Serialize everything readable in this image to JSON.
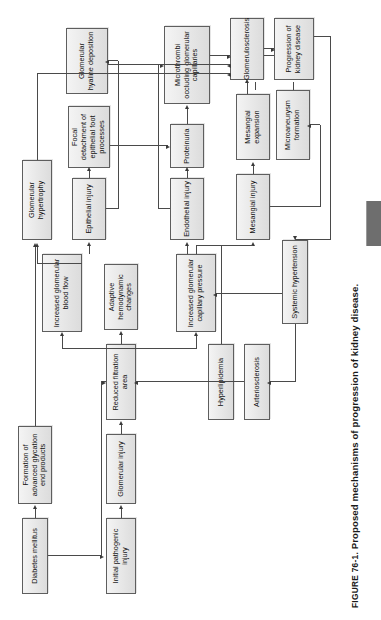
{
  "figure": {
    "number": "FIGURE 76-1.",
    "title": "Proposed mechanisms of progression of kidney disease.",
    "page_element": "printed-thumb-tab"
  },
  "diagram": {
    "type": "flowchart",
    "orientation": "rotated-90-counterclockwise",
    "nodes": [
      {
        "id": "initial_pathogenic_injury",
        "label": "Initial pathogenic injury"
      },
      {
        "id": "glomerular_injury",
        "label": "Glomerular injury"
      },
      {
        "id": "reduced_filtration_area",
        "label": "Reduced filtration area"
      },
      {
        "id": "adaptive_hemodynamic",
        "label": "Adaptive hemodynamic changes"
      },
      {
        "id": "diabetes_mellitus",
        "label": "Diabetes mellitus"
      },
      {
        "id": "advanced_glycation",
        "label": "Formation of advanced glycation end products"
      },
      {
        "id": "arteriosclerosis",
        "label": "Arteriosclerosis"
      },
      {
        "id": "hyperlipidemia",
        "label": "Hyperlipidemia"
      },
      {
        "id": "systemic_hypertension",
        "label": "Systemic hypertension"
      },
      {
        "id": "incr_glom_cap_pressure",
        "label": "Increased glomerular capillary pressure"
      },
      {
        "id": "incr_glom_blood_flow",
        "label": "Increased glomerular blood flow"
      },
      {
        "id": "mesangial_injury",
        "label": "Mesangial injury"
      },
      {
        "id": "mesangial_expansion",
        "label": "Mesangial expansion"
      },
      {
        "id": "microaneurysm_formation",
        "label": "Microaneurysm formation"
      },
      {
        "id": "endothelial_injury",
        "label": "Endothelial injury"
      },
      {
        "id": "epithelial_injury",
        "label": "Epithelial injury"
      },
      {
        "id": "proteinuria",
        "label": "Proteinuria"
      },
      {
        "id": "focal_detachment",
        "label": "Focal detachment of epithelial foot processes"
      },
      {
        "id": "glomerular_hypertrophy",
        "label": "Glomerular hypertrophy"
      },
      {
        "id": "glomerular_hyaline",
        "label": "Glomerular hyaline deposition"
      },
      {
        "id": "microthrombi",
        "label": "Microthrombi occluding glomerular capillaries"
      },
      {
        "id": "glomerulosclerosis",
        "label": "Glomerulosclerosis"
      },
      {
        "id": "progression_kidney_disease",
        "label": "Progression of kidney disease"
      }
    ],
    "edges": [
      {
        "from": "initial_pathogenic_injury",
        "to": "glomerular_injury"
      },
      {
        "from": "glomerular_injury",
        "to": "reduced_filtration_area"
      },
      {
        "from": "reduced_filtration_area",
        "to": "adaptive_hemodynamic"
      },
      {
        "from": "diabetes_mellitus",
        "to": "reduced_filtration_area"
      },
      {
        "from": "diabetes_mellitus",
        "to": "advanced_glycation"
      },
      {
        "from": "advanced_glycation",
        "to": "glomerular_hypertrophy"
      },
      {
        "from": "systemic_hypertension",
        "to": "arteriosclerosis"
      },
      {
        "from": "systemic_hypertension",
        "to": "incr_glom_cap_pressure"
      },
      {
        "from": "arteriosclerosis",
        "to": "reduced_filtration_area"
      },
      {
        "from": "hyperlipidemia",
        "to": "mesangial_injury"
      },
      {
        "from": "adaptive_hemodynamic",
        "to": "incr_glom_cap_pressure"
      },
      {
        "from": "adaptive_hemodynamic",
        "to": "incr_glom_blood_flow"
      },
      {
        "from": "incr_glom_cap_pressure",
        "to": "mesangial_injury"
      },
      {
        "from": "incr_glom_cap_pressure",
        "to": "endothelial_injury"
      },
      {
        "from": "incr_glom_blood_flow",
        "to": "epithelial_injury"
      },
      {
        "from": "incr_glom_blood_flow",
        "to": "glomerular_hypertrophy"
      },
      {
        "from": "mesangial_injury",
        "to": "mesangial_expansion"
      },
      {
        "from": "mesangial_injury",
        "to": "microaneurysm_formation"
      },
      {
        "from": "mesangial_expansion",
        "to": "glomerulosclerosis"
      },
      {
        "from": "microaneurysm_formation",
        "to": "glomerulosclerosis"
      },
      {
        "from": "endothelial_injury",
        "to": "proteinuria"
      },
      {
        "from": "endothelial_injury",
        "to": "microthrombi"
      },
      {
        "from": "epithelial_injury",
        "to": "focal_detachment"
      },
      {
        "from": "epithelial_injury",
        "to": "glomerular_hyaline"
      },
      {
        "from": "focal_detachment",
        "to": "proteinuria"
      },
      {
        "from": "proteinuria",
        "to": "microthrombi"
      },
      {
        "from": "glomerular_hyaline",
        "to": "glomerulosclerosis"
      },
      {
        "from": "microthrombi",
        "to": "glomerulosclerosis"
      },
      {
        "from": "glomerulosclerosis",
        "to": "progression_kidney_disease"
      },
      {
        "from": "glomerular_hypertrophy",
        "to": "glomerulosclerosis"
      },
      {
        "from": "progression_kidney_disease",
        "to": "systemic_hypertension"
      }
    ]
  },
  "colors": {
    "node_fill": "#e9e9e9",
    "node_border": "#5e5e5e",
    "connector": "#4a4a4a",
    "tab": "#6e6e6e",
    "page": "#ffffff",
    "text": "#111111"
  }
}
